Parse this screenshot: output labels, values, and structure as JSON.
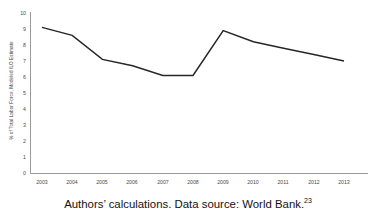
{
  "chart_data": {
    "type": "line",
    "title": "",
    "xlabel": "",
    "ylabel": "% of Total Labor Force, Modeled ILO Estimate",
    "categories": [
      "2003",
      "2004",
      "2005",
      "2006",
      "2007",
      "2008",
      "2009",
      "2010",
      "2011",
      "2012",
      "2013"
    ],
    "x": [
      2003,
      2004,
      2005,
      2006,
      2007,
      2008,
      2009,
      2010,
      2011,
      2012,
      2013
    ],
    "values": [
      9.1,
      8.6,
      7.1,
      6.7,
      6.1,
      6.1,
      8.9,
      8.2,
      7.8,
      7.4,
      7.0
    ],
    "series": [
      {
        "name": "Unemployment Rate",
        "values": [
          9.1,
          8.6,
          7.1,
          6.7,
          6.1,
          6.1,
          8.9,
          8.2,
          7.8,
          7.4,
          7.0
        ],
        "color": "#262626"
      }
    ],
    "ylim": [
      0,
      10
    ],
    "yticks": [
      0,
      1,
      2,
      3,
      4,
      5,
      6,
      7,
      8,
      9,
      10
    ],
    "ytick_labels": [
      "0",
      "1",
      "2",
      "3",
      "4",
      "5",
      "6",
      "7",
      "8",
      "9",
      "10"
    ],
    "xtick_labels": [
      "2003",
      "2004",
      "2005",
      "2006",
      "2007",
      "2008",
      "2009",
      "2010",
      "2011",
      "2012",
      "2013"
    ],
    "grid": false,
    "legend": "none",
    "line_color": "#262626",
    "axis_color": "#808080"
  },
  "caption": {
    "text": "Authors’ calculations. Data source: World Bank.",
    "footnote_marker": "23"
  }
}
